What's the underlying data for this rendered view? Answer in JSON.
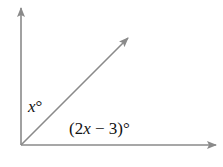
{
  "diagram": {
    "type": "adjacent-angles",
    "line_color": "#8a8a8a",
    "labels": {
      "upper_angle": {
        "var": "x",
        "suffix": "°"
      },
      "lower_angle": {
        "prefix": "(2",
        "var": "x",
        "suffix": " − 3)°"
      }
    },
    "rays": [
      "vertical-up",
      "diagonal",
      "horizontal-right"
    ]
  }
}
